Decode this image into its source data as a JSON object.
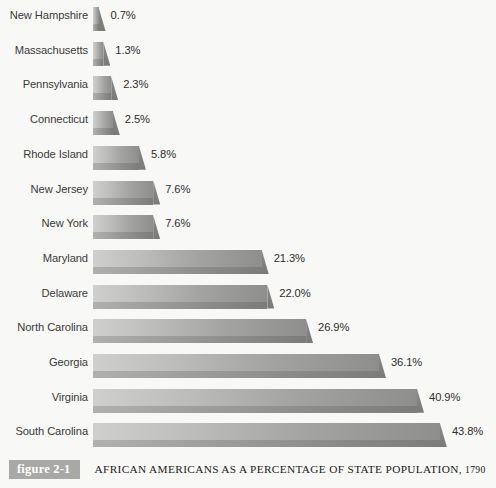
{
  "figure": {
    "tag": "figure 2-1",
    "title": "AFRICAN AMERICANS AS A PERCENTAGE OF STATE POPULATION,",
    "year": "1790"
  },
  "colors": {
    "background": "#f8f8f6",
    "bar_light": "#cfcfcd",
    "bar_dark": "#8e8e8c",
    "bar_front": "#8a8a88",
    "label_text": "#3b3b3b",
    "tag_background": "#a8a8a6",
    "tag_text": "#ffffff"
  },
  "chart_data": {
    "type": "bar",
    "orientation": "horizontal",
    "title": "AFRICAN AMERICANS AS A PERCENTAGE OF STATE POPULATION, 1790",
    "xlabel": "",
    "ylabel": "",
    "xlim": [
      0,
      43.8
    ],
    "grid": false,
    "legend": false,
    "value_suffix": "%",
    "categories": [
      "New Hampshire",
      "Massachusetts",
      "Pennsylvania",
      "Connecticut",
      "Rhode Island",
      "New Jersey",
      "New York",
      "Maryland",
      "Delaware",
      "North Carolina",
      "Georgia",
      "Virginia",
      "South Carolina"
    ],
    "values": [
      0.7,
      1.3,
      2.3,
      2.5,
      5.8,
      7.6,
      7.6,
      21.3,
      22.0,
      26.9,
      36.1,
      40.9,
      43.8
    ],
    "value_labels": [
      "0.7%",
      "1.3%",
      "2.3%",
      "2.5%",
      "5.8%",
      "7.6%",
      "7.6%",
      "21.3%",
      "22.0%",
      "26.9%",
      "36.1%",
      "40.9%",
      "43.8%"
    ]
  }
}
